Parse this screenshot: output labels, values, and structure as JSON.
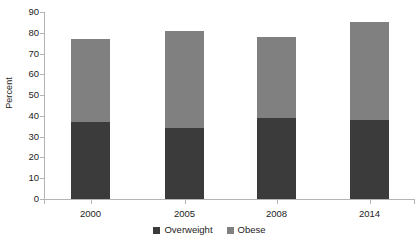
{
  "chart_data": {
    "type": "bar",
    "subtype": "stacked-bar",
    "title": "",
    "xlabel": "",
    "ylabel": "Percent",
    "categories": [
      "2000",
      "2005",
      "2008",
      "2014"
    ],
    "series": [
      {
        "name": "Overweight",
        "color": "#3b3b3b",
        "values": [
          37,
          34,
          39,
          38
        ]
      },
      {
        "name": "Obese",
        "color": "#808080",
        "values": [
          40,
          47,
          39,
          47
        ]
      }
    ],
    "totals": [
      77,
      81,
      78,
      85
    ],
    "ylim": [
      0,
      90
    ],
    "yticks": [
      0,
      10,
      20,
      30,
      40,
      50,
      60,
      70,
      80,
      90
    ],
    "ytick_labels": [
      "0",
      "10",
      "20",
      "30",
      "40",
      "50",
      "60",
      "70",
      "80",
      "90"
    ],
    "grid": false,
    "legend_position": "bottom",
    "legend": [
      "Overweight",
      "Obese"
    ]
  },
  "axis": {
    "y_title": "Percent"
  },
  "legend": {
    "items": [
      {
        "label": "Overweight",
        "color": "#3b3b3b"
      },
      {
        "label": "Obese",
        "color": "#808080"
      }
    ]
  }
}
